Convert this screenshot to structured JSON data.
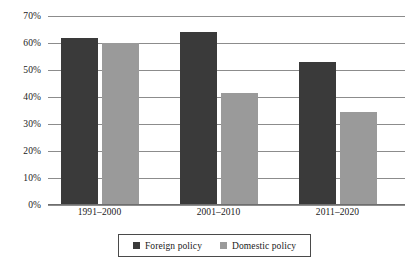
{
  "chart_data": {
    "type": "bar",
    "title": "",
    "subtitle": "",
    "xlabel": "",
    "ylabel": "",
    "categories": [
      "1991–2000",
      "2001–2010",
      "2011–2020"
    ],
    "series": [
      {
        "name": "Foreign policy",
        "color": "#3a3a3a",
        "values": [
          62,
          64,
          53
        ]
      },
      {
        "name": "Domestic policy",
        "color": "#9a9a9a",
        "values": [
          60,
          41.5,
          34.5
        ]
      }
    ],
    "ylim": [
      0,
      70
    ],
    "ytick_values": [
      0,
      10,
      20,
      30,
      40,
      50,
      60,
      70
    ],
    "ytick_labels": [
      "0%",
      "10%",
      "20%",
      "30%",
      "40%",
      "50%",
      "60%",
      "70%"
    ],
    "grid": true,
    "grid_axis": "y",
    "legend_position": "bottom",
    "legend_border": true,
    "background": "#ffffff"
  }
}
